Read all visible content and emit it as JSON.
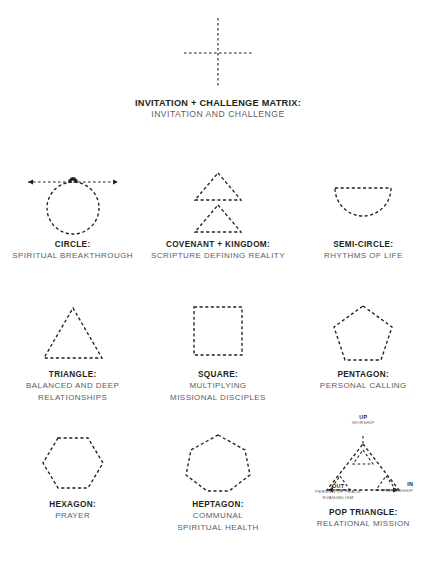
{
  "featured": {
    "icon": "dashed-cross-matrix-icon",
    "title": "INVITATION + CHALLENGE MATRIX:",
    "subtitle": "INVITATION AND CHALLENGE"
  },
  "shapes": [
    {
      "icon": "dashed-circle-with-arrow-icon",
      "title": "CIRCLE:",
      "subtitle_lines": [
        "SPIRITUAL BREAKTHROUGH"
      ]
    },
    {
      "icon": "dashed-double-triangle-icon",
      "title": "COVENANT + KINGDOM:",
      "subtitle_lines": [
        "SCRIPTURE DEFINING REALITY"
      ]
    },
    {
      "icon": "dashed-semicircle-icon",
      "title": "SEMI-CIRCLE:",
      "subtitle_lines": [
        "RHYTHMS OF LIFE"
      ]
    },
    {
      "icon": "dashed-triangle-icon",
      "title": "TRIANGLE:",
      "subtitle_lines": [
        "BALANCED AND DEEP",
        "RELATIONSHIPS"
      ]
    },
    {
      "icon": "dashed-square-icon",
      "title": "SQUARE:",
      "subtitle_lines": [
        "MULTIPLYING",
        "MISSIONAL DISCIPLES"
      ]
    },
    {
      "icon": "dashed-pentagon-icon",
      "title": "PENTAGON:",
      "subtitle_lines": [
        "PERSONAL CALLING"
      ]
    },
    {
      "icon": "dashed-hexagon-icon",
      "title": "HEXAGON:",
      "subtitle_lines": [
        "PRAYER"
      ]
    },
    {
      "icon": "dashed-heptagon-icon",
      "title": "HEPTAGON:",
      "subtitle_lines": [
        "COMMUNAL",
        "SPIRITUAL HEALTH"
      ]
    },
    {
      "icon": "dashed-pop-triangle-icon",
      "title": "POP TRIANGLE:",
      "subtitle_lines": [
        "RELATIONAL MISSION"
      ]
    }
  ],
  "pop_triangle_labels": {
    "up": "UP",
    "up_sub": "WORSHIP",
    "out": "OUT",
    "out_sub_line1": "PERSON OF PEACE",
    "out_sub_line2": "EVANGELISM",
    "in": "IN",
    "in_sub": "FELLOWSHIP"
  },
  "colors": {
    "ink": "#231f20",
    "muted": "#5d5d5f",
    "background": "#ffffff"
  }
}
